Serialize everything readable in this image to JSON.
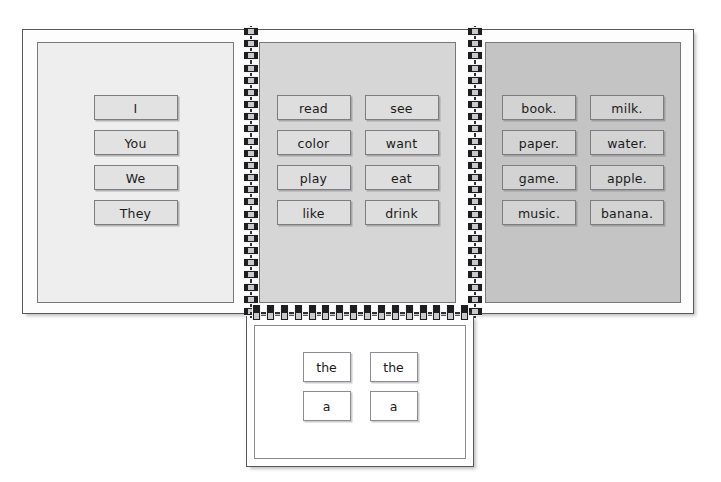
{
  "document": {
    "title": "Sentence Building Flip Book",
    "colors": {
      "panel_subjects_bg": "#eeeeee",
      "panel_verbs_bg": "#d6d6d6",
      "panel_objects_bg": "#c4c4c4",
      "card_border": "#7d7d81",
      "page_border": "#58585a",
      "spiral": "#1e1e20",
      "text": "#1b1b1b"
    }
  },
  "top_spread": {
    "panels": [
      {
        "name": "subjects",
        "columns": 1,
        "cards": [
          {
            "label": "I"
          },
          {
            "label": "You"
          },
          {
            "label": "We"
          },
          {
            "label": "They"
          }
        ]
      },
      {
        "name": "verbs",
        "columns": 2,
        "cards": [
          {
            "label": "read"
          },
          {
            "label": "see"
          },
          {
            "label": "color"
          },
          {
            "label": "want"
          },
          {
            "label": "play"
          },
          {
            "label": "eat"
          },
          {
            "label": "like"
          },
          {
            "label": "drink"
          }
        ]
      },
      {
        "name": "objects",
        "columns": 2,
        "cards": [
          {
            "label": "book."
          },
          {
            "label": "milk."
          },
          {
            "label": "paper."
          },
          {
            "label": "water."
          },
          {
            "label": "game."
          },
          {
            "label": "apple."
          },
          {
            "label": "music."
          },
          {
            "label": "banana."
          }
        ]
      }
    ]
  },
  "bottom_page": {
    "name": "articles",
    "columns": 2,
    "cards": [
      {
        "label": "the"
      },
      {
        "label": "the"
      },
      {
        "label": "a"
      },
      {
        "label": "a"
      }
    ]
  },
  "bindings": {
    "vertical_ring_count": 24,
    "horizontal_ring_count": 16
  }
}
